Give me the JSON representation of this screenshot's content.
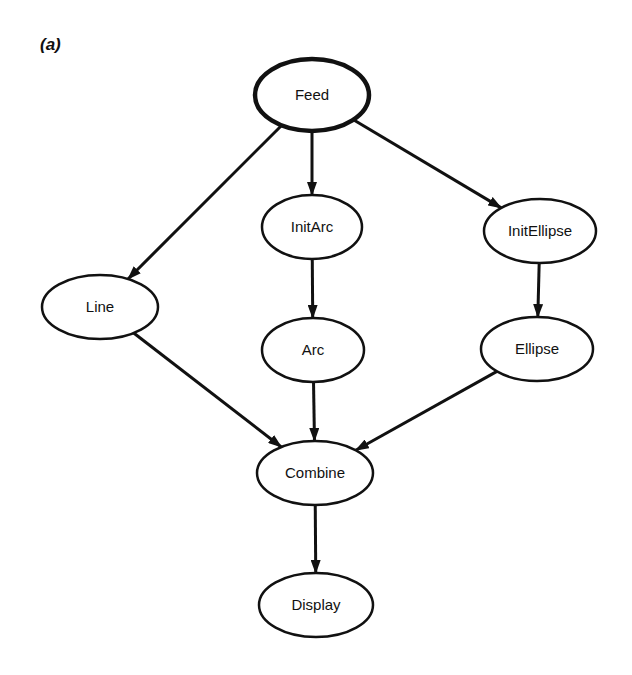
{
  "figure": {
    "panel_label": "(a)",
    "colors": {
      "stroke": "#111111",
      "background": "#ffffff",
      "node_fill": "#ffffff"
    }
  },
  "nodes": [
    {
      "id": "feed",
      "label": "Feed",
      "cx": 312,
      "cy": 95,
      "rx": 57,
      "ry": 36,
      "thick": true
    },
    {
      "id": "initarc",
      "label": "InitArc",
      "cx": 312,
      "cy": 227,
      "rx": 50,
      "ry": 32,
      "thick": false
    },
    {
      "id": "initellipse",
      "label": "InitEllipse",
      "cx": 540,
      "cy": 231,
      "rx": 56,
      "ry": 32,
      "thick": false
    },
    {
      "id": "line",
      "label": "Line",
      "cx": 100,
      "cy": 307,
      "rx": 58,
      "ry": 32,
      "thick": false
    },
    {
      "id": "arc",
      "label": "Arc",
      "cx": 313,
      "cy": 350,
      "rx": 51,
      "ry": 32,
      "thick": false
    },
    {
      "id": "ellipse",
      "label": "Ellipse",
      "cx": 537,
      "cy": 349,
      "rx": 56,
      "ry": 32,
      "thick": false
    },
    {
      "id": "combine",
      "label": "Combine",
      "cx": 315,
      "cy": 473,
      "rx": 58,
      "ry": 32,
      "thick": false
    },
    {
      "id": "display",
      "label": "Display",
      "cx": 316,
      "cy": 605,
      "rx": 57,
      "ry": 32,
      "thick": false
    }
  ],
  "edges": [
    {
      "from": "feed",
      "to": "line"
    },
    {
      "from": "feed",
      "to": "initarc"
    },
    {
      "from": "feed",
      "to": "initellipse"
    },
    {
      "from": "initarc",
      "to": "arc"
    },
    {
      "from": "initellipse",
      "to": "ellipse"
    },
    {
      "from": "line",
      "to": "combine"
    },
    {
      "from": "arc",
      "to": "combine"
    },
    {
      "from": "ellipse",
      "to": "combine"
    },
    {
      "from": "combine",
      "to": "display"
    }
  ]
}
